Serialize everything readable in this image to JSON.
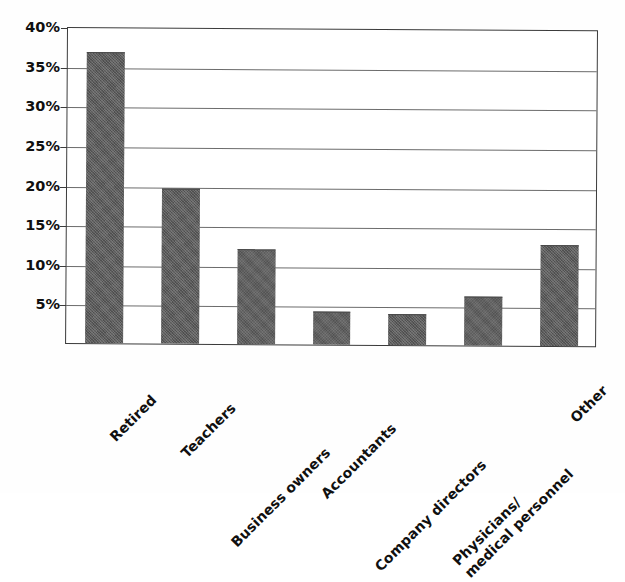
{
  "chart_data": {
    "type": "bar",
    "title": "",
    "subtitle": "",
    "xlabel": "",
    "ylabel": "",
    "categories": [
      "Retired",
      "Teachers",
      "Business owners",
      "Accountants",
      "Company directors",
      "Physicians/ medical personnel",
      "Other"
    ],
    "category_lines": [
      [
        "Retired"
      ],
      [
        "Teachers"
      ],
      [
        "Business owners"
      ],
      [
        "Accountants"
      ],
      [
        "Company directors"
      ],
      [
        "Physicians/",
        "medical personnel"
      ],
      [
        "Other"
      ]
    ],
    "values": [
      36.7,
      19.5,
      12.0,
      4.2,
      3.9,
      6.2,
      12.7
    ],
    "value_labels": [
      "",
      "",
      "",
      "",
      "",
      "",
      ""
    ],
    "ylim": [
      0,
      40
    ],
    "ytick_values": [
      5,
      10,
      15,
      20,
      25,
      30,
      35,
      40
    ],
    "ytick_labels": [
      "5%",
      "10%",
      "15%",
      "20%",
      "25%",
      "30%",
      "35%",
      "40%"
    ],
    "grid": true,
    "grid_axis": "y",
    "legend": false,
    "legend_position": "none",
    "bar_color": "#5c5c5c",
    "axis_color": "#3b3b3b",
    "gridline_color": "#6c6c6c",
    "background_color": "#ffffff",
    "annotations": []
  },
  "figure": {
    "plot_border": true,
    "label_rotation_degrees": 45,
    "series_count": 1
  }
}
